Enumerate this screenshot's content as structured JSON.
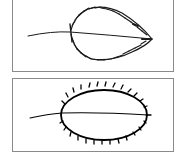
{
  "figure": {
    "panels": [
      {
        "id": "top",
        "subject": "leaf outline with fine forward-pointing serrations (serrate margin)",
        "stroke_color": "#1a1a1a"
      },
      {
        "id": "bottom",
        "subject": "oval leaf outline with sparse hooked teeth (toothed margin)",
        "stroke_color": "#000000"
      }
    ],
    "frame_color": "#8a8a8a"
  }
}
